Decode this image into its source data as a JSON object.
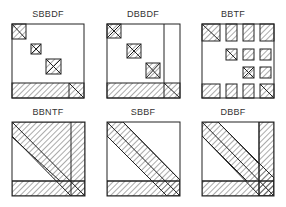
{
  "diagram": {
    "panels": [
      {
        "id": "sbbdf",
        "label": "SBBDF",
        "x": 3,
        "y": 9,
        "structure": "single-bordered block-diagonal form"
      },
      {
        "id": "dbbdf",
        "label": "DBBDF",
        "x": 98,
        "y": 9,
        "structure": "doubly-bordered block-diagonal form"
      },
      {
        "id": "bbtf",
        "label": "BBTF",
        "x": 188,
        "y": 9,
        "structure": "bordered block-triangular form"
      },
      {
        "id": "bbntf",
        "label": "BBNTF",
        "x": 3,
        "y": 107,
        "structure": "bordered band non-triangular form"
      },
      {
        "id": "sbbf",
        "label": "SBBF",
        "x": 98,
        "y": 107,
        "structure": "single-bordered band form"
      },
      {
        "id": "dbbf",
        "label": "DBBF",
        "x": 188,
        "y": 107,
        "structure": "doubly-bordered band form"
      }
    ],
    "colors": {
      "stroke": "#222222",
      "hatch": "#444444",
      "background": "#ffffff",
      "label": "#333333"
    }
  }
}
